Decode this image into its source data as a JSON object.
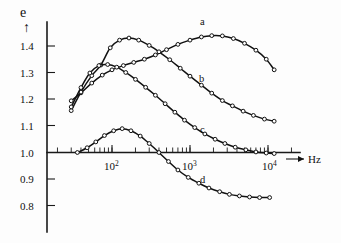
{
  "figure": {
    "name": "dielectric-dispersion-plot",
    "y_axis_symbol": "e",
    "y_axis_arrow": "↑",
    "x_axis_unit": "Hz",
    "x_axis_arrow": "⟶"
  },
  "y_ticks": [
    {
      "label": "1.4",
      "value": 1.4
    },
    {
      "label": "1.3",
      "value": 1.3
    },
    {
      "label": "1.2",
      "value": 1.2
    },
    {
      "label": "1.1",
      "value": 1.1
    },
    {
      "label": "1.0",
      "value": 1.0
    },
    {
      "label": "0.9",
      "value": 0.9
    },
    {
      "label": "0.8",
      "value": 0.8
    }
  ],
  "x_ticks": [
    {
      "mantissa": "10",
      "exponent": "2",
      "value": 100
    },
    {
      "mantissa": "10",
      "exponent": "3",
      "value": 1000
    },
    {
      "mantissa": "10",
      "exponent": "4",
      "value": 10000
    }
  ],
  "curve_labels": [
    {
      "id": "a",
      "label": "a"
    },
    {
      "id": "b",
      "label": "b"
    },
    {
      "id": "c",
      "label": "c"
    },
    {
      "id": "d",
      "label": "d"
    }
  ],
  "chart_data": {
    "type": "line",
    "title": "",
    "subtitle": "",
    "xlabel": "Hz",
    "ylabel": "e",
    "xscale": "log",
    "yscale": "linear",
    "xlim": [
      20,
      13000
    ],
    "ylim": [
      0.8,
      1.47
    ],
    "grid": false,
    "legend_position": "inline-right-of-curve",
    "markers": "open-circle",
    "annotations": [
      {
        "text": "a",
        "x": 1800,
        "y": 1.455
      },
      {
        "text": "b",
        "x": 1700,
        "y": 1.3
      },
      {
        "text": "c",
        "x": 1800,
        "y": 1.11
      },
      {
        "text": "d",
        "x": 1800,
        "y": 0.895
      }
    ],
    "series": [
      {
        "name": "a",
        "x": [
          30,
          40,
          55,
          75,
          100,
          140,
          190,
          260,
          360,
          500,
          700,
          1000,
          1400,
          1900,
          2600,
          3600,
          5000,
          7000,
          9500,
          12000
        ],
        "y": [
          1.195,
          1.225,
          1.262,
          1.292,
          1.312,
          1.328,
          1.34,
          1.352,
          1.368,
          1.388,
          1.408,
          1.424,
          1.436,
          1.441,
          1.44,
          1.43,
          1.412,
          1.386,
          1.352,
          1.312
        ]
      },
      {
        "name": "b",
        "x": [
          30,
          40,
          55,
          72,
          95,
          125,
          165,
          220,
          300,
          400,
          550,
          750,
          1000,
          1400,
          1900,
          2600,
          3500,
          4800,
          6500,
          9000,
          12000
        ],
        "y": [
          1.158,
          1.228,
          1.29,
          1.33,
          1.395,
          1.424,
          1.432,
          1.424,
          1.404,
          1.38,
          1.35,
          1.318,
          1.288,
          1.254,
          1.224,
          1.196,
          1.176,
          1.156,
          1.14,
          1.126,
          1.118
        ]
      },
      {
        "name": "c",
        "x": [
          30,
          40,
          52,
          68,
          88,
          115,
          150,
          200,
          270,
          360,
          480,
          640,
          850,
          1150,
          1550,
          2100,
          2800,
          3800,
          5200,
          7000,
          9500,
          12000
        ],
        "y": [
          1.172,
          1.245,
          1.3,
          1.328,
          1.332,
          1.322,
          1.302,
          1.276,
          1.246,
          1.216,
          1.184,
          1.152,
          1.122,
          1.094,
          1.07,
          1.05,
          1.034,
          1.02,
          1.01,
          1.002,
          0.998,
          0.996
        ]
      },
      {
        "name": "d",
        "x": [
          36,
          48,
          62,
          80,
          105,
          135,
          175,
          230,
          300,
          400,
          530,
          700,
          950,
          1300,
          1750,
          2400,
          3200,
          4300,
          5800,
          7800,
          10500
        ],
        "y": [
          1.0,
          1.018,
          1.04,
          1.064,
          1.082,
          1.09,
          1.082,
          1.062,
          1.034,
          1.0,
          0.966,
          0.934,
          0.906,
          0.884,
          0.866,
          0.852,
          0.842,
          0.836,
          0.832,
          0.83,
          0.83
        ]
      }
    ]
  }
}
